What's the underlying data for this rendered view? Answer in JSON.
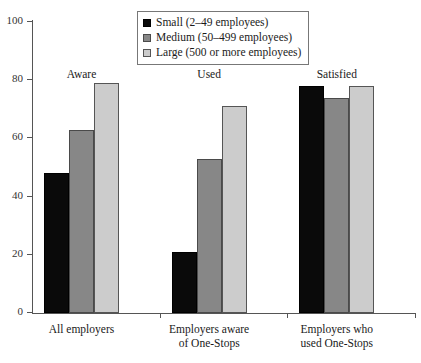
{
  "chart_data": {
    "type": "bar",
    "title": "",
    "xlabel": "",
    "ylabel": "",
    "ylim": [
      0,
      100
    ],
    "yticks": [
      0,
      20,
      40,
      60,
      80,
      100
    ],
    "grid": false,
    "legend_position": "top-center",
    "categories": [
      "All employers",
      "Employers aware of One-Stops",
      "Employers who used One-Stops"
    ],
    "category_lines": [
      [
        "All employers"
      ],
      [
        "Employers aware",
        "of One-Stops"
      ],
      [
        "Employers who",
        "used One-Stops"
      ]
    ],
    "group_headings": [
      "Aware",
      "Used",
      "Satisfied"
    ],
    "series": [
      {
        "name": "Small (2–49 employees)",
        "color": "#0a0a0a",
        "values": [
          48,
          21,
          78
        ]
      },
      {
        "name": "Medium (50–499 employees)",
        "color": "#878787",
        "values": [
          63,
          53,
          74
        ]
      },
      {
        "name": "Large (500 or more employees)",
        "color": "#cccccc",
        "values": [
          79,
          71,
          78
        ]
      }
    ]
  }
}
